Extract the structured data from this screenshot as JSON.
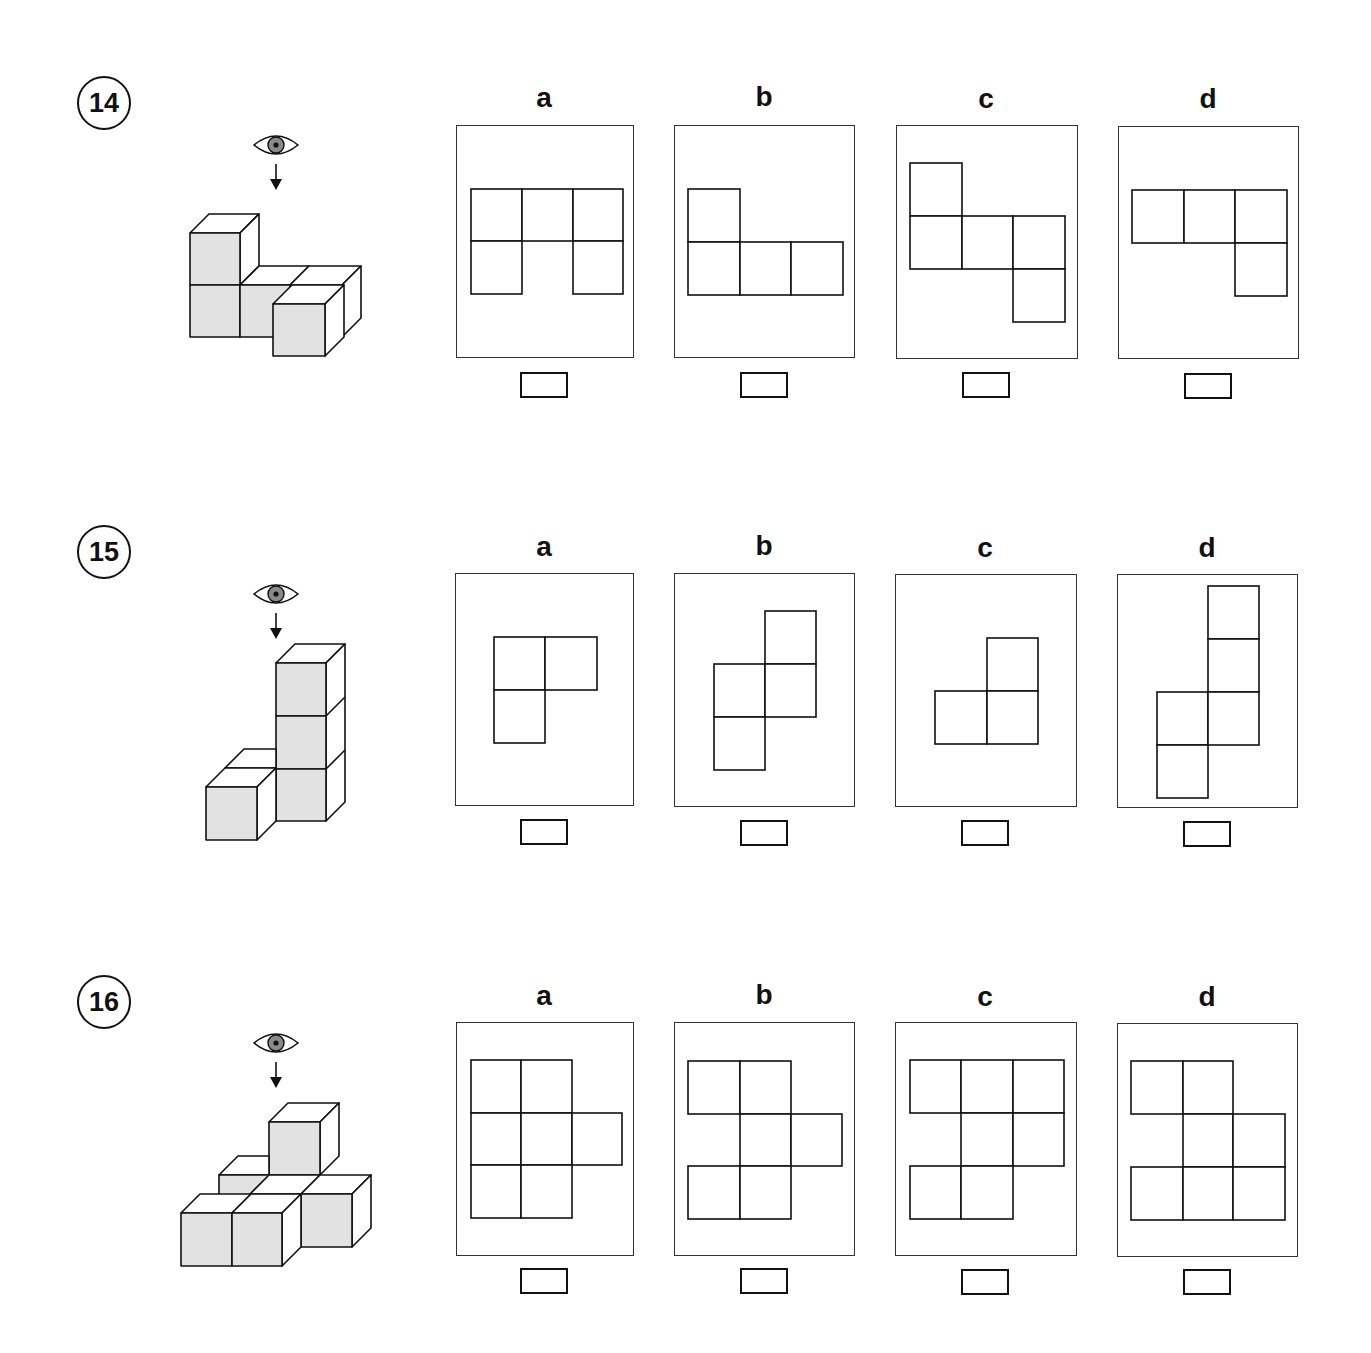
{
  "worksheet": {
    "colors": {
      "cube_front": "#e2e2e2",
      "cube_other": "#ffffff",
      "stroke": "#111111",
      "eye_iris": "#8a8a8a"
    },
    "unit_px": 51,
    "questions": [
      {
        "number": "14",
        "eye_icon": "eye-icon",
        "arrow_icon": "arrow-down-icon",
        "options": [
          {
            "label": "a",
            "cells": [
              [
                0,
                0
              ],
              [
                1,
                0
              ],
              [
                2,
                0
              ],
              [
                0,
                1
              ],
              [
                2,
                1
              ]
            ],
            "origin": [
              14,
              63
            ]
          },
          {
            "label": "b",
            "cells": [
              [
                0,
                0
              ],
              [
                0,
                1
              ],
              [
                1,
                1
              ],
              [
                2,
                1
              ]
            ],
            "origin": [
              14,
              63
            ]
          },
          {
            "label": "c",
            "cells": [
              [
                0,
                0
              ],
              [
                0,
                1
              ],
              [
                1,
                1
              ],
              [
                2,
                1
              ],
              [
                2,
                2
              ]
            ],
            "origin": [
              14,
              37
            ]
          },
          {
            "label": "d",
            "cells": [
              [
                0,
                0
              ],
              [
                1,
                0
              ],
              [
                2,
                0
              ],
              [
                2,
                1
              ]
            ],
            "origin": [
              14,
              63
            ]
          }
        ]
      },
      {
        "number": "15",
        "eye_icon": "eye-icon",
        "arrow_icon": "arrow-down-icon",
        "options": [
          {
            "label": "a",
            "cells": [
              [
                0,
                0
              ],
              [
                1,
                0
              ],
              [
                0,
                1
              ]
            ],
            "origin": [
              38,
              63
            ]
          },
          {
            "label": "b",
            "cells": [
              [
                1,
                0
              ],
              [
                0,
                1
              ],
              [
                1,
                1
              ],
              [
                0,
                2
              ]
            ],
            "origin": [
              39,
              37
            ]
          },
          {
            "label": "c",
            "cells": [
              [
                1,
                0
              ],
              [
                0,
                1
              ],
              [
                1,
                1
              ]
            ],
            "origin": [
              39,
              63
            ]
          },
          {
            "label": "d",
            "cells": [
              [
                1,
                0
              ],
              [
                1,
                1
              ],
              [
                0,
                2
              ],
              [
                1,
                2
              ],
              [
                0,
                3
              ]
            ],
            "origin": [
              39,
              11
            ]
          }
        ]
      },
      {
        "number": "16",
        "eye_icon": "eye-icon",
        "arrow_icon": "arrow-down-icon",
        "options": [
          {
            "label": "a",
            "cells": [
              [
                0,
                0
              ],
              [
                1,
                0
              ],
              [
                0,
                1
              ],
              [
                1,
                1
              ],
              [
                2,
                1
              ],
              [
                0,
                2
              ],
              [
                1,
                2
              ]
            ],
            "origin": [
              14,
              37
            ]
          },
          {
            "label": "b",
            "cells": [
              [
                0,
                0
              ],
              [
                1,
                0
              ],
              [
                1,
                1
              ],
              [
                2,
                1
              ],
              [
                0,
                2
              ],
              [
                1,
                2
              ]
            ],
            "origin": [
              14,
              37
            ]
          },
          {
            "label": "c",
            "cells": [
              [
                0,
                0
              ],
              [
                1,
                0
              ],
              [
                2,
                0
              ],
              [
                1,
                1
              ],
              [
                2,
                1
              ],
              [
                0,
                2
              ],
              [
                1,
                2
              ]
            ],
            "origin": [
              13,
              37
            ]
          },
          {
            "label": "d",
            "cells": [
              [
                0,
                0
              ],
              [
                1,
                0
              ],
              [
                1,
                1
              ],
              [
                2,
                1
              ],
              [
                0,
                2
              ],
              [
                1,
                2
              ],
              [
                2,
                2
              ]
            ],
            "origin": [
              13,
              37
            ]
          }
        ]
      }
    ]
  }
}
